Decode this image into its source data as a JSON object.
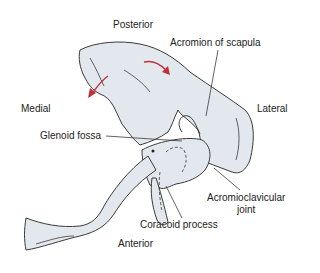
{
  "diagram": {
    "orientation_labels": {
      "posterior": "Posterior",
      "anterior": "Anterior",
      "medial": "Medial",
      "lateral": "Lateral"
    },
    "structure_labels": {
      "acromion": "Acromion of scapula",
      "glenoid": "Glenoid fossa",
      "coracoid": "Coracoid process",
      "ac_joint_line1": "Acromioclavicular",
      "ac_joint_line2": "joint"
    },
    "colors": {
      "bone_fill": "#e3e8ee",
      "outline": "#3a3a3a",
      "arrow": "#c0303a"
    }
  }
}
